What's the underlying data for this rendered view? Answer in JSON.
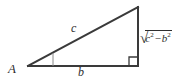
{
  "figure": {
    "type": "geometry-diagram",
    "background_color": "#ffffff",
    "stroke_color": "#3a3a3a",
    "text_color": "#2e2e2e"
  },
  "labels": {
    "vertex_A": "A",
    "hypotenuse": "c",
    "base": "b",
    "vertical_side": {
      "radical_sign": "√",
      "term1_base": "c",
      "term1_exponent": "2",
      "operator": "−",
      "term2_base": "b",
      "term2_exponent": "2",
      "plain_text": "√(c² − b²)"
    }
  },
  "geometry": {
    "vertex_left": {
      "x": 28,
      "y": 66
    },
    "vertex_apex": {
      "x": 138,
      "y": 7
    },
    "vertex_right": {
      "x": 138,
      "y": 66
    },
    "angle_mark_at_A": true,
    "right_angle_mark_at_right": true
  }
}
